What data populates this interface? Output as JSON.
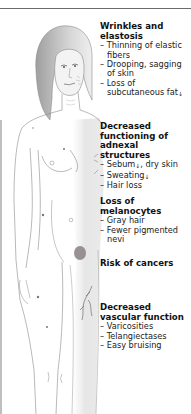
{
  "figure": {
    "colors": {
      "outline": "#7a7a7a",
      "shade": "#d9d9d9",
      "hair": "#c4c4c4",
      "lesion": "#8a7f86",
      "vein": "#6f6f6f"
    }
  },
  "labels": [
    {
      "heading": "Wrinkles and elastosis",
      "items": [
        "Thinning of elastic fibers",
        "Drooping, sagging of skin",
        "Loss of subcutaneous fat"
      ],
      "arrows": [
        null,
        null,
        "down-arrow"
      ]
    },
    {
      "heading": "Decreased functioning of adnexal structures",
      "items": [
        "Sebum",
        ", dry skin",
        "Sweating",
        "Hair loss"
      ]
    },
    {
      "heading": "Loss of melanocytes",
      "items": [
        "Gray hair",
        "Fewer pigmented nevi"
      ]
    },
    {
      "heading": "Risk of cancers",
      "items": []
    },
    {
      "heading": "Decreased vascular function",
      "items": [
        "Varicosities",
        "Telangiectases",
        "Easy bruising"
      ]
    }
  ],
  "symbols": {
    "dash": "–",
    "down_arrow": "↓"
  }
}
